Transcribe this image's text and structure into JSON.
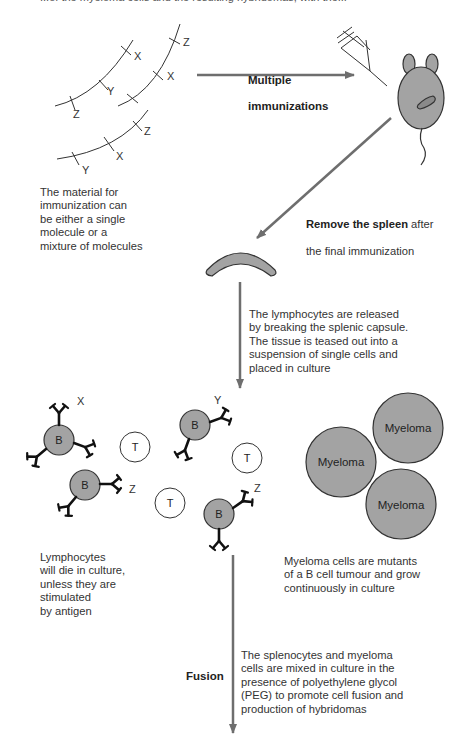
{
  "top_strip": {
    "text": "...of the myeloma cells and the resulting hybridomas, with the..."
  },
  "step1": {
    "antigen_labels": [
      "X",
      "Y",
      "Z",
      "Z",
      "X",
      "Z",
      "X",
      "Y"
    ],
    "arrow_label_line1": "Multiple",
    "arrow_label_line2": "immunizations",
    "caption": "The material for\nimmunization can\nbe either a single\nmolecule or a\nmixture of molecules"
  },
  "step2": {
    "arrow_label_bold": "Remove the spleen",
    "arrow_label_rest": " after",
    "arrow_label_line2": "the final immunization"
  },
  "step3": {
    "caption": "The lymphocytes are released\nby breaking the splenic capsule.\nThe tissue is teased out into a\nsuspension of single cells and\nplaced in culture"
  },
  "cells": {
    "b_cell_label": "B",
    "t_cell_label": "T",
    "b_cell_antigens": [
      "X",
      "Z",
      "Y",
      "Z"
    ],
    "myeloma_labels": [
      "Myeloma",
      "Myeloma",
      "Myeloma"
    ],
    "lymphocyte_caption": "Lymphocytes\nwill die in culture,\nunless they are\nstimulated\nby antigen",
    "myeloma_caption": "Myeloma cells are mutants\nof a B cell tumour and grow\ncontinuously in culture"
  },
  "fusion": {
    "label": "Fusion",
    "caption": "The splenocytes and myeloma\ncells are mixed in culture in the\npresence of polyethylene glycol\n(PEG) to promote cell fusion and\nproduction of hybridomas"
  },
  "colors": {
    "arrow": "#6e6e6e",
    "cell_fill": "#a3a3a3",
    "outline": "#333333",
    "antibody": "#111111"
  }
}
